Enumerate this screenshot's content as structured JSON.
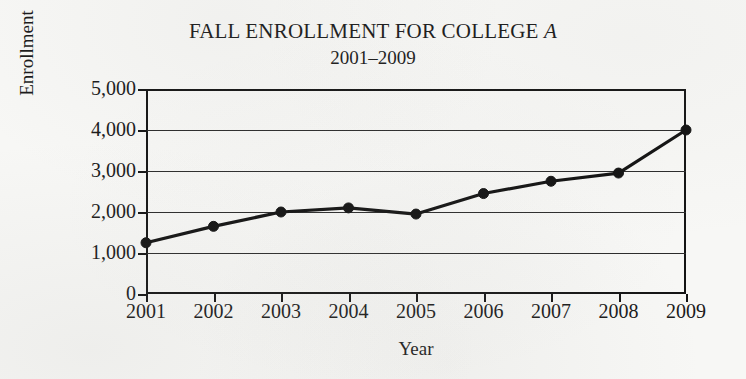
{
  "chart_data": {
    "type": "line",
    "title": "FALL ENROLLMENT FOR COLLEGE A",
    "title_plain": "FALL ENROLLMENT FOR COLLEGE ",
    "title_italic": "A",
    "subtitle": "2001–2009",
    "xlabel": "Year",
    "ylabel": "Enrollment",
    "categories": [
      "2001",
      "2002",
      "2003",
      "2004",
      "2005",
      "2006",
      "2007",
      "2008",
      "2009"
    ],
    "x": [
      2001,
      2002,
      2003,
      2004,
      2005,
      2006,
      2007,
      2008,
      2009
    ],
    "values": [
      1250,
      1650,
      2000,
      2100,
      1950,
      2450,
      2750,
      2950,
      4000
    ],
    "ylim": [
      0,
      5000
    ],
    "ytick_values": [
      0,
      1000,
      2000,
      3000,
      4000,
      5000
    ],
    "ytick_labels": [
      "0",
      "1,000",
      "2,000",
      "3,000",
      "4,000",
      "5,000"
    ],
    "xtick_labels": [
      "2001",
      "2002",
      "2003",
      "2004",
      "2005",
      "2006",
      "2007",
      "2008",
      "2009"
    ],
    "grid": true,
    "grid_axis": "y",
    "legend": false,
    "legend_position": "none",
    "marker": "filled-circle",
    "line_color": "#121212",
    "grid_color": "#2b2b2b",
    "axis_color": "#141414",
    "background_color": "#f7f7f5"
  }
}
